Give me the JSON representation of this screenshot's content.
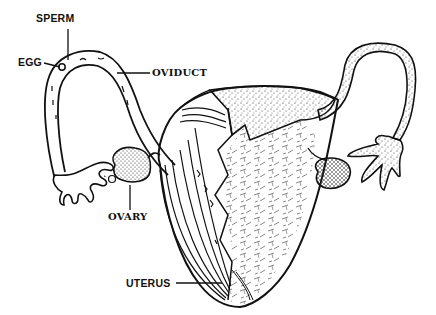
{
  "diagram": {
    "labels": {
      "sperm": "SPERM",
      "egg": "EGG",
      "oviduct": "OVIDUCT",
      "ovary": "OVARY",
      "uterus": "UTERUS"
    },
    "colors": {
      "ink": "#111111",
      "background": "#ffffff"
    }
  }
}
